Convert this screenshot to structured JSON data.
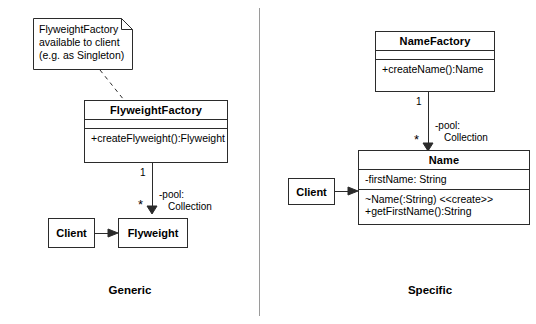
{
  "diagram": {
    "left_panel": {
      "caption": "Generic",
      "note": {
        "lines": [
          "FlyweightFactory",
          "available to client",
          "(e.g. as Singleton)"
        ]
      },
      "factory_class": {
        "name": "FlyweightFactory",
        "attributes": [],
        "operations": [
          "+createFlyweight():Flyweight"
        ]
      },
      "association": {
        "source_multiplicity": "1",
        "target_multiplicity": "*",
        "role_line1": "-pool:",
        "role_line2": "Collection"
      },
      "client_box": "Client",
      "product_box": "Flyweight"
    },
    "right_panel": {
      "caption": "Specific",
      "factory_class": {
        "name": "NameFactory",
        "attributes": [],
        "operations": [
          "+createName():Name"
        ]
      },
      "association": {
        "source_multiplicity": "1",
        "target_multiplicity": "*",
        "role_line1": "-pool:",
        "role_line2": "Collection"
      },
      "client_box": "Client",
      "product_class": {
        "name": "Name",
        "attributes": [
          "-firstName: String"
        ],
        "operations": [
          "~Name(:String) <<create>>",
          "+getFirstName():String"
        ]
      }
    },
    "colors": {
      "line": "#2b2b2b",
      "divider": "#9a9a9a",
      "background": "#ffffff",
      "text": "#000000"
    }
  }
}
